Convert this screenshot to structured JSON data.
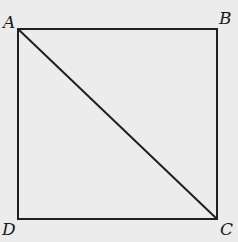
{
  "diagram": {
    "type": "square with diagonal",
    "points": {
      "A": {
        "label": "A",
        "x": 18,
        "y": 29
      },
      "B": {
        "label": "B",
        "x": 217,
        "y": 29
      },
      "C": {
        "label": "C",
        "x": 217,
        "y": 219
      },
      "D": {
        "label": "D",
        "x": 18,
        "y": 219
      }
    },
    "segments": [
      "AB",
      "BC",
      "CD",
      "DA",
      "AC"
    ],
    "colors": {
      "line": "#1f1f1f",
      "background": "#ececec"
    }
  }
}
